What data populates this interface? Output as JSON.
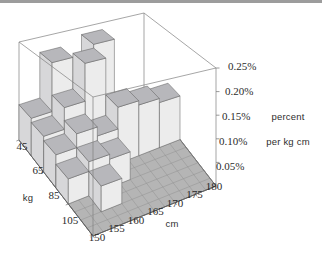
{
  "page": {
    "background": "#ffffff",
    "top_strip_color": "#9c9c9c"
  },
  "chart_data": {
    "type": "bar",
    "subtype": "3d-histogram",
    "title": "",
    "x_axis": {
      "label": "cm",
      "ticks": [
        "150",
        "155",
        "160",
        "165",
        "170",
        "175",
        "180"
      ],
      "range": [
        150,
        180
      ],
      "bin_width": 5
    },
    "y_axis": {
      "label": "kg",
      "ticks": [
        "45",
        "65",
        "85",
        "105"
      ],
      "range": [
        45,
        105
      ],
      "bin_width": 10
    },
    "z_axis": {
      "title_line1": "percent",
      "title_line2": "per kg cm",
      "ticks": [
        "0.05%",
        "0.10%",
        "0.15%",
        "0.20%",
        "0.25%"
      ],
      "tick_values": [
        0.05,
        0.1,
        0.15,
        0.2,
        0.25
      ],
      "range": [
        0,
        0.25
      ]
    },
    "kg_bins": [
      [
        45,
        55
      ],
      [
        55,
        65
      ],
      [
        65,
        75
      ],
      [
        75,
        85
      ],
      [
        85,
        95
      ],
      [
        95,
        105
      ]
    ],
    "cm_bins": [
      [
        150,
        155
      ],
      [
        155,
        160
      ],
      [
        160,
        165
      ],
      [
        165,
        170
      ],
      [
        170,
        175
      ],
      [
        175,
        180
      ]
    ],
    "values_percent_per_kg_cm": [
      [
        0.09,
        0.21,
        0.12,
        0.23,
        0.0,
        0.0
      ],
      [
        0.08,
        0.13,
        0.22,
        0.07,
        0.0,
        0.0
      ],
      [
        0.07,
        0.1,
        0.08,
        0.13,
        0.12,
        0.11
      ],
      [
        0.05,
        0.07,
        0.06,
        0.0,
        0.0,
        0.0
      ],
      [
        0.0,
        0.05,
        0.0,
        0.0,
        0.0,
        0.0
      ],
      [
        0.0,
        0.0,
        0.0,
        0.0,
        0.0,
        0.0
      ]
    ],
    "legend_position": "right",
    "grid": true,
    "colors": {
      "bar_top": "#b7b7bb",
      "bar_front": "#ececec",
      "bar_side": "#d7d7d9",
      "bar_edge": "#5a5a5a",
      "floor": "#b5b5b5",
      "floor_grid": "#8d8d8d",
      "floor_outline": "#5f5f5f",
      "wireframe": "#808080",
      "text": "#2b2b2b"
    }
  }
}
